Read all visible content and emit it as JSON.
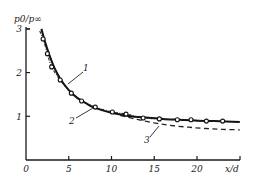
{
  "chart_data": {
    "type": "line",
    "title": "",
    "xlabel": "x/d",
    "ylabel": "p0/p∞",
    "xlim": [
      0,
      25
    ],
    "ylim": [
      0,
      3
    ],
    "x_ticks": [
      0,
      5,
      10,
      15,
      20
    ],
    "x_tick_labels": [
      "0",
      "5",
      "10",
      "15",
      "20"
    ],
    "y_ticks": [
      1,
      2,
      3
    ],
    "y_tick_labels": [
      "1",
      "2",
      "3"
    ],
    "grid": false,
    "legend": "inline labels",
    "series": [
      {
        "name": "1",
        "style": "solid-thick",
        "x": [
          1.8,
          2.2,
          2.7,
          3.3,
          4.0,
          5.0,
          6.0,
          7.0,
          8.0,
          10.0,
          12.0,
          14.0,
          16.0,
          18.0,
          20.0,
          22.0,
          25.0
        ],
        "y": [
          3.0,
          2.72,
          2.42,
          2.12,
          1.86,
          1.6,
          1.42,
          1.3,
          1.2,
          1.08,
          1.01,
          0.97,
          0.94,
          0.92,
          0.9,
          0.89,
          0.87
        ]
      },
      {
        "name": "2",
        "style": "dash-dot",
        "x": [
          1.6,
          2.0,
          2.5,
          3.0,
          4.0,
          5.3,
          6.5,
          8.1,
          10.1,
          11.7,
          13.7,
          15.6,
          17.7,
          19.3,
          21.1,
          23.0
        ],
        "y": [
          2.95,
          2.77,
          2.43,
          2.13,
          1.83,
          1.53,
          1.35,
          1.21,
          1.1,
          1.05,
          0.96,
          0.94,
          0.92,
          0.92,
          0.89,
          0.89
        ]
      },
      {
        "name": "3",
        "style": "dashed",
        "x": [
          11.0,
          13.0,
          15.0,
          17.0,
          19.0,
          21.0,
          23.0,
          25.0
        ],
        "y": [
          1.02,
          0.93,
          0.85,
          0.79,
          0.75,
          0.72,
          0.7,
          0.69
        ]
      },
      {
        "name": "experiment",
        "style": "open-circle-markers",
        "x": [
          2.0,
          2.5,
          3.0,
          4.0,
          5.3,
          6.5,
          8.1,
          10.1,
          11.7,
          13.7,
          15.6,
          17.7,
          19.3,
          21.1,
          23.0
        ],
        "y": [
          2.77,
          2.43,
          2.13,
          1.83,
          1.53,
          1.35,
          1.21,
          1.1,
          1.05,
          0.96,
          0.94,
          0.92,
          0.92,
          0.89,
          0.89
        ]
      }
    ],
    "annotations": [
      {
        "text": "1",
        "target_series": "1"
      },
      {
        "text": "2",
        "target_series": "2"
      },
      {
        "text": "3",
        "target_series": "3"
      }
    ]
  }
}
